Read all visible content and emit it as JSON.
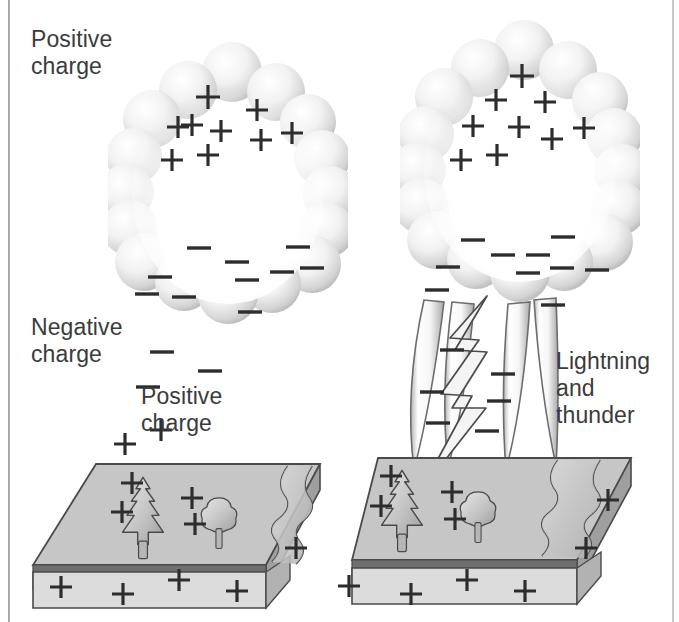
{
  "labels": {
    "positive_charge_top": "Positive\ncharge",
    "negative_charge": "Negative\ncharge",
    "positive_charge_middle": "Positive\ncharge",
    "lightning_and_thunder": "Lightning\nand\nthunder"
  },
  "symbols": {
    "plus": "+",
    "minus": "−"
  },
  "colors": {
    "background": "#ffffff",
    "text": "#3b3b3b",
    "rule": "#a9a9a9",
    "cloud_light": "#ffffff",
    "cloud_mid": "#d8d8d8",
    "cloud_edge": "#a6a6a6",
    "ground_top": "#c6c6c6",
    "ground_side": "#b2b2b2",
    "ground_seam": "#6f6f6f",
    "ground_front": "#d2d2d2",
    "outline": "#4a4a4a",
    "bolt_fill": "#f2f2f2",
    "rain_light": "#fbfbfb",
    "rain_shade": "#b9b9b9"
  },
  "panels": [
    {
      "id": "left-panel",
      "name": "calm-thundercloud-panel",
      "has_lightning": false,
      "cloud": {
        "positive_charges": [
          {
            "x": 208,
            "y": 97
          },
          {
            "x": 192,
            "y": 125
          },
          {
            "x": 257,
            "y": 110
          },
          {
            "x": 178,
            "y": 127
          },
          {
            "x": 221,
            "y": 131
          },
          {
            "x": 261,
            "y": 140
          },
          {
            "x": 292,
            "y": 133
          },
          {
            "x": 172,
            "y": 160
          },
          {
            "x": 208,
            "y": 155
          }
        ],
        "negative_charges": [
          {
            "x": 199,
            "y": 248
          },
          {
            "x": 237,
            "y": 262
          },
          {
            "x": 160,
            "y": 277
          },
          {
            "x": 282,
            "y": 272
          },
          {
            "x": 247,
            "y": 280
          },
          {
            "x": 298,
            "y": 247
          },
          {
            "x": 312,
            "y": 268
          },
          {
            "x": 147,
            "y": 294
          },
          {
            "x": 184,
            "y": 297
          },
          {
            "x": 250,
            "y": 312
          }
        ]
      },
      "air_negative_charges": [
        {
          "x": 162,
          "y": 352
        },
        {
          "x": 210,
          "y": 371
        },
        {
          "x": 148,
          "y": 387
        }
      ],
      "air_positive_charges": [
        {
          "x": 161,
          "y": 430
        },
        {
          "x": 125,
          "y": 444
        }
      ],
      "ground": {
        "top_positive_charges": [
          {
            "x": 132,
            "y": 483
          },
          {
            "x": 122,
            "y": 512
          },
          {
            "x": 192,
            "y": 498
          },
          {
            "x": 195,
            "y": 524
          },
          {
            "x": 296,
            "y": 548
          }
        ],
        "front_positive_charges": [
          {
            "x": 61,
            "y": 587
          },
          {
            "x": 123,
            "y": 594
          },
          {
            "x": 179,
            "y": 580
          },
          {
            "x": 237,
            "y": 591
          }
        ]
      }
    },
    {
      "id": "right-panel",
      "name": "lightning-strike-panel",
      "has_lightning": true,
      "cloud": {
        "positive_charges": [
          {
            "x": 522,
            "y": 75
          },
          {
            "x": 496,
            "y": 100
          },
          {
            "x": 545,
            "y": 102
          },
          {
            "x": 473,
            "y": 126
          },
          {
            "x": 519,
            "y": 127
          },
          {
            "x": 552,
            "y": 139
          },
          {
            "x": 584,
            "y": 128
          },
          {
            "x": 461,
            "y": 160
          },
          {
            "x": 497,
            "y": 155
          }
        ],
        "negative_charges": [
          {
            "x": 473,
            "y": 240
          },
          {
            "x": 503,
            "y": 255
          },
          {
            "x": 448,
            "y": 267
          },
          {
            "x": 563,
            "y": 237
          },
          {
            "x": 562,
            "y": 268
          },
          {
            "x": 597,
            "y": 270
          },
          {
            "x": 528,
            "y": 273
          },
          {
            "x": 538,
            "y": 255
          },
          {
            "x": 437,
            "y": 290
          },
          {
            "x": 553,
            "y": 305
          }
        ]
      },
      "rain_negative_charges": [
        {
          "x": 452,
          "y": 350
        },
        {
          "x": 503,
          "y": 374
        },
        {
          "x": 432,
          "y": 392
        },
        {
          "x": 499,
          "y": 401
        },
        {
          "x": 438,
          "y": 423
        },
        {
          "x": 487,
          "y": 431
        }
      ],
      "ground": {
        "top_positive_charges": [
          {
            "x": 391,
            "y": 476
          },
          {
            "x": 381,
            "y": 506
          },
          {
            "x": 452,
            "y": 492
          },
          {
            "x": 455,
            "y": 519
          },
          {
            "x": 608,
            "y": 500
          },
          {
            "x": 586,
            "y": 548
          }
        ],
        "front_positive_charges": [
          {
            "x": 349,
            "y": 586
          },
          {
            "x": 411,
            "y": 594
          },
          {
            "x": 467,
            "y": 580
          },
          {
            "x": 525,
            "y": 591
          }
        ]
      }
    }
  ],
  "elements": {
    "cloud_name": "thundercloud",
    "ground_name": "ground-slab",
    "tree_large_name": "conifer-tree",
    "tree_small_name": "deciduous-tree",
    "river_name": "river",
    "bolt_name": "lightning-bolt",
    "rain_name": "rain-shaft"
  }
}
